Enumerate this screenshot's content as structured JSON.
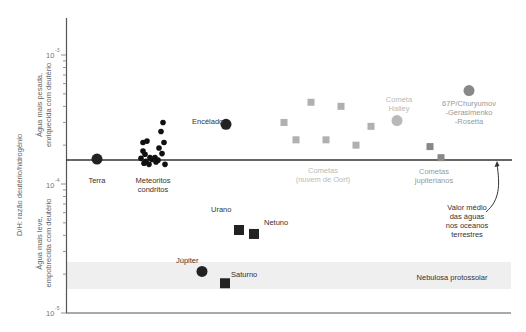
{
  "chart_data": {
    "type": "scatter",
    "title": "",
    "ylabel": "D/H: razão deutério/hidrogênio",
    "y_scale": "log",
    "ylim": [
      1e-05,
      0.002
    ],
    "y_ticks": [
      {
        "value": 0.001,
        "base": "10",
        "exp": "-3"
      },
      {
        "value": 0.0001,
        "base": "10",
        "exp": "-4"
      },
      {
        "value": 1e-05,
        "base": "10",
        "exp": "-5"
      }
    ],
    "y_region_labels": {
      "upper_line1": "Água mais pesada,",
      "upper_line2": "enriquecida com deutério",
      "lower_line1": "Água mais leve,",
      "lower_line2": "empobrecida com deutério"
    },
    "reference_line": {
      "value": 0.000156,
      "label": [
        "Valor médio",
        "das águas",
        "nos oceanos",
        "terrestres"
      ]
    },
    "band": {
      "range": [
        1.5e-05,
        2.5e-05
      ],
      "label": "Nebulosa protossolar",
      "color": "#efefef"
    },
    "grid": false,
    "legend": null,
    "groups": [
      {
        "name": "Terra",
        "label": [
          "Terra"
        ],
        "marker": "circle",
        "color": "#222222",
        "points": [
          {
            "x": 97,
            "y": 0.000156
          }
        ]
      },
      {
        "name": "Meteoritos condritos",
        "label": [
          "Meteoritos",
          "condritos"
        ],
        "marker": "circle-small",
        "color": "#111111",
        "points": [
          {
            "x": 144,
            "y": 0.000145
          },
          {
            "x": 146,
            "y": 0.00015
          },
          {
            "x": 149,
            "y": 0.000142
          },
          {
            "x": 152,
            "y": 0.000155
          },
          {
            "x": 156,
            "y": 0.000148
          },
          {
            "x": 158,
            "y": 0.000153
          },
          {
            "x": 141,
            "y": 0.000158
          },
          {
            "x": 145,
            "y": 0.00017
          },
          {
            "x": 143,
            "y": 0.00018
          },
          {
            "x": 147,
            "y": 0.000215
          },
          {
            "x": 143,
            "y": 0.00021
          },
          {
            "x": 159,
            "y": 0.00019
          },
          {
            "x": 164,
            "y": 0.00021
          },
          {
            "x": 162,
            "y": 0.000172
          },
          {
            "x": 165,
            "y": 0.000142
          },
          {
            "x": 161,
            "y": 0.000255
          },
          {
            "x": 163,
            "y": 0.0003
          },
          {
            "x": 155,
            "y": 0.00016
          },
          {
            "x": 150,
            "y": 0.00016
          }
        ]
      },
      {
        "name": "Encélado",
        "label": [
          "Encélado"
        ],
        "marker": "circle",
        "color": "#222222",
        "points": [
          {
            "x": 226,
            "y": 0.00029
          }
        ]
      },
      {
        "name": "Cometas (nuvem de Oort)",
        "label": [
          "Cometas",
          "(nuvem de Oort)"
        ],
        "marker": "square",
        "color": "#b0b0b0",
        "points": [
          {
            "x": 284,
            "y": 0.0003
          },
          {
            "x": 296,
            "y": 0.00022
          },
          {
            "x": 311,
            "y": 0.00043
          },
          {
            "x": 326,
            "y": 0.00022
          },
          {
            "x": 341,
            "y": 0.0004
          },
          {
            "x": 356,
            "y": 0.0002
          },
          {
            "x": 371,
            "y": 0.00028
          }
        ]
      },
      {
        "name": "Cometa Halley",
        "label": [
          "Cometa",
          "Halley"
        ],
        "marker": "circle",
        "color": "#b9b9b9",
        "points": [
          {
            "x": 397,
            "y": 0.00031
          }
        ]
      },
      {
        "name": "67P/Churyumov-Gerasimenko-Rosetta",
        "label": [
          "67P/Churyumov",
          "-Gerasimenko",
          "-Rosetta"
        ],
        "marker": "circle",
        "color": "#888888",
        "points": [
          {
            "x": 469,
            "y": 0.00053
          }
        ]
      },
      {
        "name": "Cometas jupiterianos",
        "label": [
          "Cometas",
          "jupiterianos"
        ],
        "marker": "square",
        "color": "#888888",
        "points": [
          {
            "x": 430,
            "y": 0.000195
          },
          {
            "x": 441,
            "y": 0.00016
          }
        ]
      },
      {
        "name": "Urano",
        "label": [
          "Urano"
        ],
        "marker": "square",
        "color": "#222222",
        "points": [
          {
            "x": 239,
            "y": 4.4e-05
          }
        ]
      },
      {
        "name": "Netuno",
        "label": [
          "Netuno"
        ],
        "marker": "square",
        "color": "#222222",
        "points": [
          {
            "x": 254,
            "y": 4.1e-05
          }
        ]
      },
      {
        "name": "Júpiter",
        "label": [
          "Júpiter"
        ],
        "marker": "circle",
        "color": "#222222",
        "points": [
          {
            "x": 202,
            "y": 2.1e-05
          }
        ]
      },
      {
        "name": "Saturno",
        "label": [
          "Saturno"
        ],
        "marker": "square",
        "color": "#222222",
        "points": [
          {
            "x": 225,
            "y": 1.7e-05
          }
        ]
      }
    ]
  }
}
